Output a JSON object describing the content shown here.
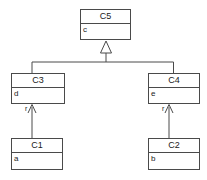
{
  "diagram": {
    "type": "uml-class-diagram",
    "title": "",
    "background_color": "#ffffff",
    "line_color": "#4a4a4a",
    "text_color": "#1a1a1a",
    "classes": [
      {
        "id": "C5",
        "name": "C5",
        "attributes": [
          "c"
        ],
        "x": 80,
        "y": 9,
        "w": 51,
        "h": 31
      },
      {
        "id": "C3",
        "name": "C3",
        "attributes": [
          "d"
        ],
        "x": 11,
        "y": 73,
        "w": 54,
        "h": 31
      },
      {
        "id": "C4",
        "name": "C4",
        "attributes": [
          "e"
        ],
        "x": 148,
        "y": 73,
        "w": 52,
        "h": 31
      },
      {
        "id": "C1",
        "name": "C1",
        "attributes": [
          "a"
        ],
        "x": 11,
        "y": 138,
        "w": 52,
        "h": 32
      },
      {
        "id": "C2",
        "name": "C2",
        "attributes": [
          "b"
        ],
        "x": 148,
        "y": 138,
        "w": 52,
        "h": 32
      }
    ],
    "generalizations": [
      {
        "from": "C3",
        "to": "C5",
        "arrow": "hollow-triangle"
      },
      {
        "from": "C4",
        "to": "C5",
        "arrow": "hollow-triangle"
      }
    ],
    "associations": [
      {
        "from": "C1",
        "to": "C3",
        "role_label": "r",
        "arrow": "open-arrow"
      },
      {
        "from": "C2",
        "to": "C4",
        "role_label": "r",
        "arrow": "open-arrow"
      }
    ],
    "role_labels": [
      {
        "text": "r",
        "x": 25,
        "y": 105
      },
      {
        "text": "r",
        "x": 162,
        "y": 105
      }
    ]
  }
}
